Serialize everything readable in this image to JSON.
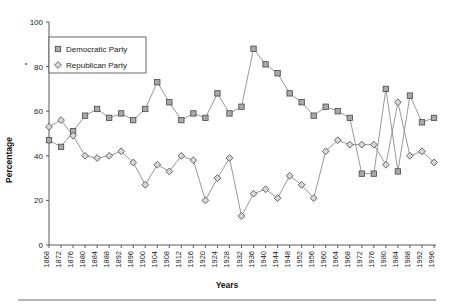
{
  "chart_data": {
    "type": "line",
    "title": "",
    "xlabel": "Years",
    "ylabel": "Percentage",
    "ylim": [
      0,
      100
    ],
    "yticks": [
      0,
      20,
      40,
      60,
      80,
      100
    ],
    "grid": false,
    "legend_position": "top-left-inside",
    "categories": [
      "1868",
      "1872",
      "1876",
      "1880",
      "1884",
      "1888",
      "1892",
      "1896",
      "1900",
      "1904",
      "1908",
      "1912",
      "1916",
      "1920",
      "1924",
      "1928",
      "1932",
      "1936",
      "1940",
      "1944",
      "1948",
      "1952",
      "1956",
      "1960",
      "1964",
      "1968",
      "1972",
      "1976",
      "1980",
      "1984",
      "1988",
      "1992",
      "1996"
    ],
    "series": [
      {
        "name": "Democratic Party",
        "marker": "square",
        "values": [
          47,
          44,
          51,
          58,
          61,
          57,
          59,
          56,
          61,
          73,
          64,
          56,
          59,
          57,
          68,
          59,
          62,
          88,
          81,
          77,
          68,
          64,
          58,
          62,
          60,
          57,
          32,
          32,
          70,
          33,
          67,
          55,
          57
        ]
      },
      {
        "name": "Republican Party",
        "marker": "diamond",
        "values": [
          53,
          56,
          49,
          40,
          39,
          40,
          42,
          37,
          27,
          36,
          33,
          40,
          38,
          20,
          30,
          39,
          13,
          23,
          25,
          21,
          31,
          27,
          21,
          42,
          47,
          45,
          45,
          45,
          36,
          64,
          40,
          42,
          37
        ]
      }
    ]
  },
  "legend": {
    "items": [
      {
        "label": "Democratic Party",
        "marker": "square"
      },
      {
        "label": "Republican Party",
        "marker": "diamond"
      }
    ]
  },
  "axes": {
    "y_title": "Percentage",
    "x_title": "Years"
  }
}
